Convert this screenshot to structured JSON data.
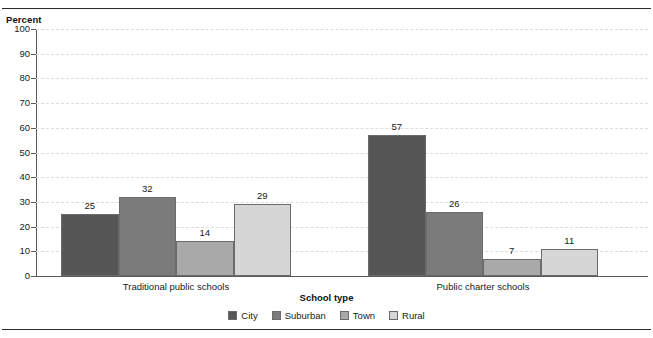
{
  "chart_data": {
    "type": "bar",
    "title": "",
    "ylabel": "Percent",
    "xlabel": "School type",
    "categories": [
      "Traditional public schools",
      "Public charter schools"
    ],
    "series": [
      {
        "name": "City",
        "values": [
          25,
          57
        ],
        "color": "#565656"
      },
      {
        "name": "Suburban",
        "values": [
          32,
          26
        ],
        "color": "#7b7b7b"
      },
      {
        "name": "Town",
        "values": [
          14,
          7
        ],
        "color": "#a9a9a9"
      },
      {
        "name": "Rural",
        "values": [
          29,
          11
        ],
        "color": "#d6d6d6"
      }
    ],
    "ylim": [
      0,
      100
    ],
    "yticks": [
      0,
      10,
      20,
      30,
      40,
      50,
      60,
      70,
      80,
      90,
      100
    ],
    "ytick_labels": [
      "0",
      "10",
      "20",
      "30",
      "40",
      "50",
      "60",
      "70",
      "80",
      "90",
      "100"
    ],
    "grid": true,
    "legend_position": "bottom",
    "data_labels": true
  },
  "legend": {
    "items": [
      {
        "label": "City",
        "color": "#565656"
      },
      {
        "label": "Suburban",
        "color": "#7b7b7b"
      },
      {
        "label": "Town",
        "color": "#a9a9a9"
      },
      {
        "label": "Rural",
        "color": "#d6d6d6"
      }
    ]
  },
  "axis": {
    "y_title": "Percent",
    "x_title": "School type"
  }
}
